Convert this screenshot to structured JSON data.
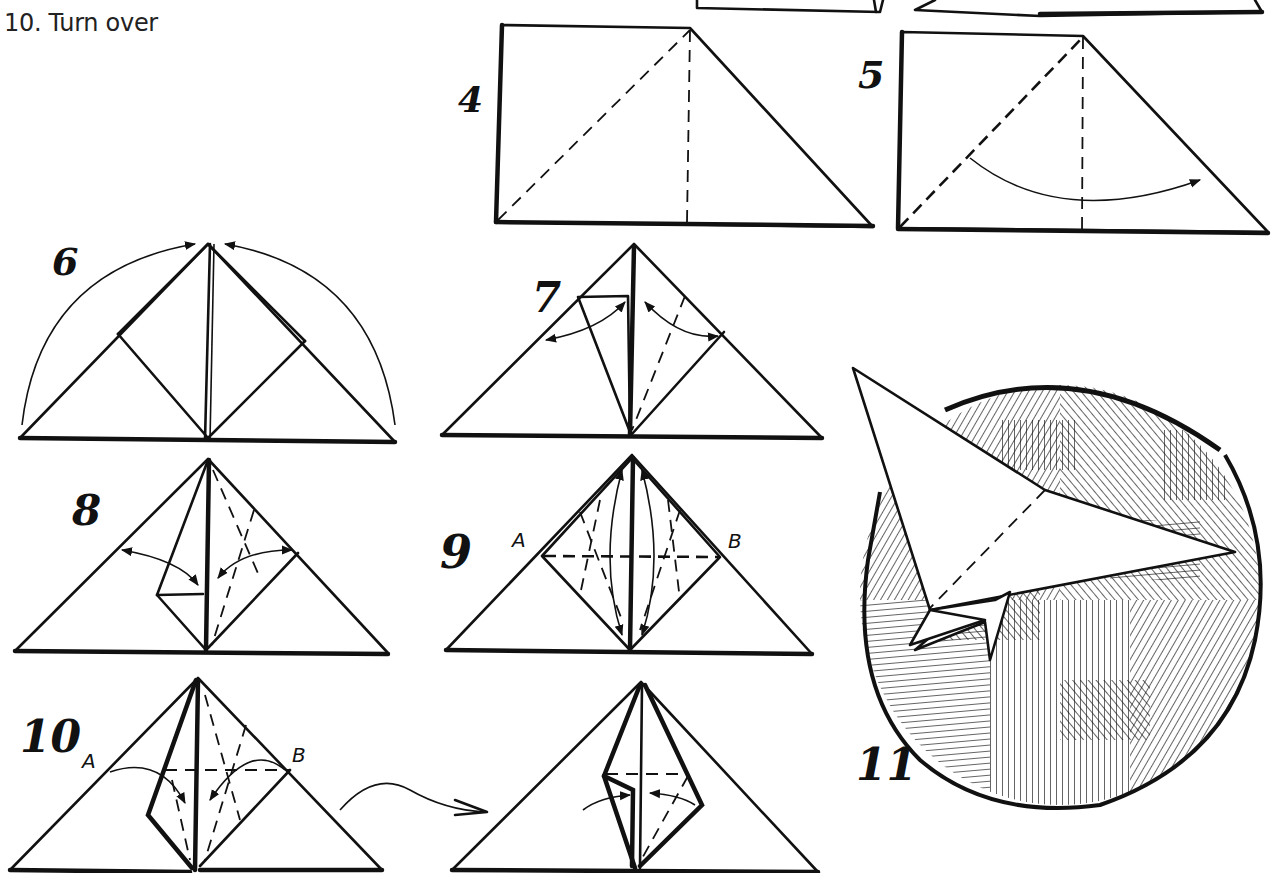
{
  "caption": "10. Turn over",
  "steps": {
    "step4": {
      "number": "4"
    },
    "step5": {
      "number": "5"
    },
    "step6": {
      "number": "6"
    },
    "step7": {
      "number": "7"
    },
    "step8": {
      "number": "8"
    },
    "step9": {
      "number": "9",
      "point_a": "A",
      "point_b": "B"
    },
    "step10": {
      "number": "10",
      "point_a": "A",
      "point_b": "B"
    },
    "step11": {
      "number": "11"
    }
  },
  "colors": {
    "ink": "#111111",
    "background": "#ffffff"
  }
}
